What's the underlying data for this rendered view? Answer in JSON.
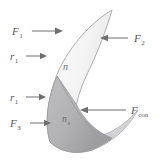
{
  "figure": {
    "shape_name": "crescent-lune",
    "colors": {
      "background": "#ffffff",
      "outer_crescent_fill_light": "#fbfbfb",
      "outer_crescent_fill_mid": "#e9e9ea",
      "outer_crescent_fill_shadow": "#d2d2d4",
      "inner_region_fill": "#b4b4b6",
      "inner_region_fill_dark": "#a3a3a5",
      "outline": "#9a9a9c",
      "arrow": "#6f6f71",
      "label_text": "#58585a",
      "inner_label_text": "#6e6e70"
    }
  },
  "labels": {
    "force_top_left": {
      "symbol": "F",
      "subscript": "1",
      "full": "F1"
    },
    "force_right": {
      "symbol": "F",
      "subscript": "2",
      "full": "F2"
    },
    "force_bottom_left": {
      "symbol": "F",
      "subscript": "3",
      "full": "F3"
    },
    "force_contact": {
      "symbol": "F",
      "subscript": "con",
      "full": "Fcon"
    },
    "radius_upper": {
      "symbol": "r",
      "subscript": "1",
      "full": "r1"
    },
    "radius_lower": {
      "symbol": "r",
      "subscript": "1",
      "full": "r1"
    },
    "region_outer": {
      "symbol": "n",
      "subscript": "",
      "full": "n"
    },
    "region_inner": {
      "symbol": "n",
      "subscript": "s",
      "full": "ns"
    }
  },
  "arrows": [
    {
      "name": "arrow-F1",
      "direction": "right",
      "points_to": "upper-left crescent edge"
    },
    {
      "name": "arrow-r1-upper",
      "direction": "right",
      "points_to": "upper-left crescent edge"
    },
    {
      "name": "arrow-r1-lower",
      "direction": "right",
      "points_to": "inner region left edge"
    },
    {
      "name": "arrow-F3",
      "direction": "right",
      "points_to": "inner region lower-left edge"
    },
    {
      "name": "arrow-F2",
      "direction": "left",
      "points_to": "upper-right crescent edge"
    },
    {
      "name": "arrow-Fcon",
      "direction": "left",
      "points_to": "inner region boundary"
    }
  ]
}
